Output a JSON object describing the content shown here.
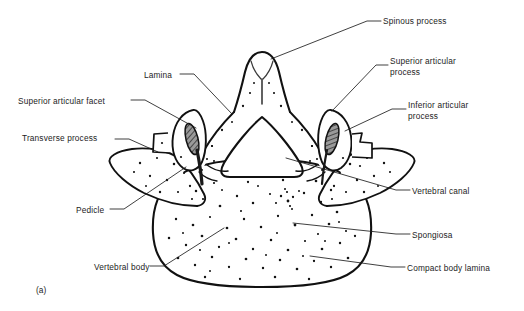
{
  "figure": {
    "caption": "(a)",
    "line_color": "#111111",
    "text_color": "#1d1d1d",
    "background": "#ffffff"
  },
  "labels": [
    {
      "id": "spinous-process",
      "text": "Spinous process",
      "x": 383,
      "y": 16,
      "side": "right"
    },
    {
      "id": "superior-articular-process",
      "text": "Superior articular\nprocess",
      "x": 390,
      "y": 56,
      "side": "right"
    },
    {
      "id": "inferior-articular-process",
      "text": "Inferior articular\nprocess",
      "x": 408,
      "y": 100,
      "side": "right"
    },
    {
      "id": "vertebral-canal",
      "text": "Vertebral canal",
      "x": 412,
      "y": 186,
      "side": "right"
    },
    {
      "id": "spongiosa",
      "text": "Spongiosa",
      "x": 412,
      "y": 230,
      "side": "right"
    },
    {
      "id": "compact-body-lamina",
      "text": "Compact body lamina",
      "x": 407,
      "y": 263,
      "side": "right"
    },
    {
      "id": "lamina",
      "text": "Lamina",
      "x": 144,
      "y": 70,
      "side": "left"
    },
    {
      "id": "superior-articular-facet",
      "text": "Superior articular facet",
      "x": 18,
      "y": 96,
      "side": "left"
    },
    {
      "id": "transverse-process",
      "text": "Transverse process",
      "x": 22,
      "y": 133,
      "side": "left"
    },
    {
      "id": "pedicle",
      "text": "Pedicle",
      "x": 76,
      "y": 205,
      "side": "left"
    },
    {
      "id": "vertebral-body",
      "text": "Vertebral body",
      "x": 94,
      "y": 262,
      "side": "left"
    }
  ],
  "leaders": [
    {
      "id": "leader-spinous-process",
      "d": "M381,21 L367,21 L271,59"
    },
    {
      "id": "leader-superior-articular-process",
      "d": "M388,65 L376,65 L332,111"
    },
    {
      "id": "leader-inferior-articular-process",
      "d": "M406,109 L392,109 L345,131"
    },
    {
      "id": "leader-vertebral-canal",
      "d": "M410,190 L396,190 L286,158"
    },
    {
      "id": "leader-spongiosa",
      "d": "M410,234 L396,234 L293,223"
    },
    {
      "id": "leader-compact-body-lamina",
      "d": "M405,267 L391,267 L310,256"
    },
    {
      "id": "leader-lamina",
      "d": "M180,74 L194,74 L232,114"
    },
    {
      "id": "leader-superior-articular-facet",
      "d": "M131,100 L145,100 L196,128"
    },
    {
      "id": "leader-transverse-process",
      "d": "M115,139 L129,139 L158,152"
    },
    {
      "id": "leader-pedicle",
      "d": "M110,209 L124,209 L186,167"
    },
    {
      "id": "leader-vertebral-body",
      "d": "M150,266 L164,266 L224,228"
    }
  ],
  "structures": [
    {
      "id": "spinous-process-outline",
      "name": "spinous process"
    },
    {
      "id": "vertebral-canal-outline",
      "name": "vertebral canal"
    },
    {
      "id": "vertebral-body-outline",
      "name": "vertebral body"
    },
    {
      "id": "left-transverse-process",
      "name": "left transverse process"
    },
    {
      "id": "right-transverse-process",
      "name": "right transverse process"
    },
    {
      "id": "left-articular-facet",
      "name": "left superior articular facet"
    },
    {
      "id": "right-articular-facet",
      "name": "right superior articular facet"
    }
  ]
}
